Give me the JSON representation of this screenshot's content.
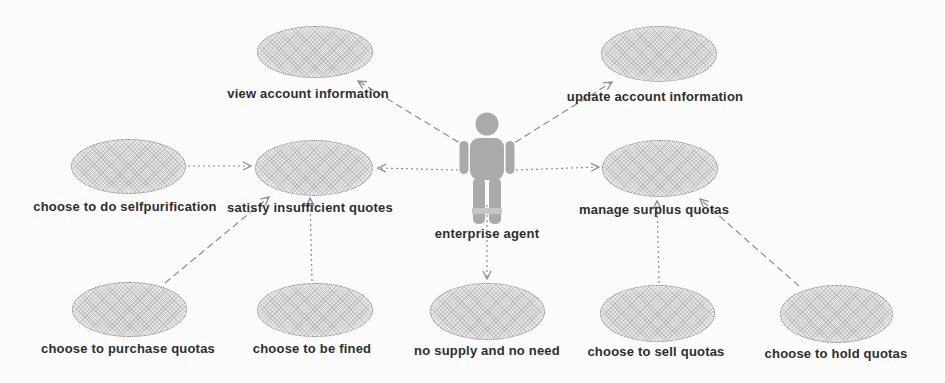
{
  "diagram": {
    "type": "UML use case diagram",
    "actor": {
      "label": "enterprise agent"
    },
    "use_cases": [
      {
        "id": "view-account-information",
        "label": "view account information"
      },
      {
        "id": "update-account-information",
        "label": "update account information"
      },
      {
        "id": "choose-to-do-selfpurification",
        "label": "choose to do selfpurification"
      },
      {
        "id": "satisfy-insufficient-quotes",
        "label": "satisfy insufficient quotes"
      },
      {
        "id": "manage-surplus-quotas",
        "label": "manage surplus quotas"
      },
      {
        "id": "choose-to-purchase-quotas",
        "label": "choose to purchase quotas"
      },
      {
        "id": "choose-to-be-fined",
        "label": "choose to be fined"
      },
      {
        "id": "no-supply-and-no-need",
        "label": "no supply and no need"
      },
      {
        "id": "choose-to-sell-quotas",
        "label": "choose to sell quotas"
      },
      {
        "id": "choose-to-hold-quotas",
        "label": "choose to hold quotas"
      }
    ],
    "connections": [
      {
        "from": "enterprise agent",
        "to": "view account information",
        "line": "dashed",
        "arrow": "open"
      },
      {
        "from": "enterprise agent",
        "to": "update account information",
        "line": "dashed",
        "arrow": "open"
      },
      {
        "from": "enterprise agent",
        "to": "satisfy insufficient quotes",
        "line": "dotted",
        "arrow": "open"
      },
      {
        "from": "enterprise agent",
        "to": "manage surplus quotas",
        "line": "dotted",
        "arrow": "open"
      },
      {
        "from": "enterprise agent",
        "to": "no supply and no need",
        "line": "dotted",
        "arrow": "open"
      },
      {
        "from": "choose to do selfpurification",
        "to": "satisfy insufficient quotes",
        "line": "dotted",
        "arrow": "open"
      },
      {
        "from": "choose to purchase quotas",
        "to": "satisfy insufficient quotes",
        "line": "dashed",
        "arrow": "open"
      },
      {
        "from": "choose to be fined",
        "to": "satisfy insufficient quotes",
        "line": "dotted",
        "arrow": "open"
      },
      {
        "from": "choose to sell quotas",
        "to": "manage surplus quotas",
        "line": "dotted",
        "arrow": "open"
      },
      {
        "from": "choose to hold quotas",
        "to": "manage surplus quotas",
        "line": "dashed",
        "arrow": "open"
      }
    ],
    "colors": {
      "background": "#fcfcfc",
      "ellipse_fill": "#e4e4e4",
      "ellipse_border": "#868686",
      "connector": "#8f8f8f",
      "actor_fill": "#aaaaaa",
      "label_text": "#2e2e2e"
    }
  }
}
